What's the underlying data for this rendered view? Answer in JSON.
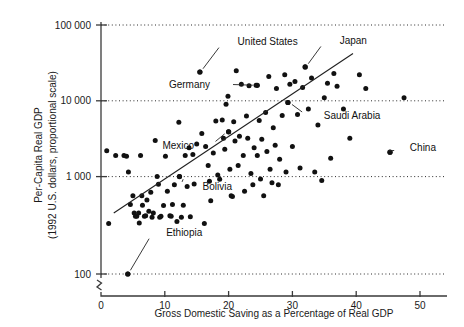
{
  "chart_data": {
    "type": "scatter",
    "title": "",
    "xlabel": "Gross Domestic Saving as a Percentage of Real GDP",
    "ylabel_line1": "Per-Capita Real GDP",
    "ylabel_line2": "(1992 U.S. dollars, proportional scale)",
    "yscale": "log",
    "xlim": [
      0,
      55
    ],
    "ylim": [
      100,
      100000
    ],
    "xticks": [
      0,
      10,
      20,
      30,
      40,
      50
    ],
    "xtick_labels": [
      "0",
      "10",
      "20",
      "30",
      "40",
      "50"
    ],
    "yticks": [
      100,
      1000,
      10000,
      100000
    ],
    "ytick_labels": [
      "100",
      "1 000",
      "10 000",
      "100 000"
    ],
    "grid": "horizontal dotted at each y tick",
    "axis_break": "y-axis broken between 100 and baseline",
    "legend": "none",
    "trendline": {
      "label": "regression line",
      "x_start": 2.0,
      "y_start": 330,
      "x_end": 39.5,
      "y_end": 42000
    },
    "annotations": [
      {
        "label": "United States",
        "x": 15.5,
        "y": 24000,
        "label_x": 20.0,
        "label_y": 60000
      },
      {
        "label": "Japan",
        "x": 32.0,
        "y": 28000,
        "label_x": 36.0,
        "label_y": 62000
      },
      {
        "label": "Germany",
        "x": 24.5,
        "y": 16000,
        "label_x": 18.5,
        "label_y": 16500
      },
      {
        "label": "Mexico",
        "x": 20.0,
        "y": 3900,
        "label_x": 16.0,
        "label_y": 2600
      },
      {
        "label": "Saudi Arabia",
        "x": 29.3,
        "y": 9500,
        "label_x": 33.5,
        "label_y": 6400
      },
      {
        "label": "China",
        "x": 45.3,
        "y": 2100,
        "label_x": 47.0,
        "label_y": 2400
      },
      {
        "label": "Bolivia",
        "x": 12.3,
        "y": 1000,
        "label_x": 14.5,
        "label_y": 740
      },
      {
        "label": "Ethiopia",
        "x": 4.2,
        "y": 100,
        "label_x": 8.8,
        "label_y": 185
      }
    ],
    "points": [
      [
        0.9,
        2200
      ],
      [
        1.2,
        240
      ],
      [
        2.3,
        1900
      ],
      [
        3.6,
        1900
      ],
      [
        4.0,
        1850
      ],
      [
        4.3,
        1150
      ],
      [
        4.2,
        100
      ],
      [
        4.6,
        430
      ],
      [
        5.0,
        560
      ],
      [
        5.2,
        330
      ],
      [
        5.4,
        300
      ],
      [
        5.6,
        300
      ],
      [
        5.9,
        330
      ],
      [
        6.0,
        245
      ],
      [
        6.2,
        1900
      ],
      [
        6.4,
        560
      ],
      [
        6.5,
        420
      ],
      [
        6.8,
        300
      ],
      [
        7.0,
        305
      ],
      [
        7.2,
        490
      ],
      [
        7.5,
        350
      ],
      [
        7.8,
        620
      ],
      [
        8.0,
        290
      ],
      [
        8.2,
        330
      ],
      [
        8.5,
        3000
      ],
      [
        8.8,
        1000
      ],
      [
        9.0,
        790
      ],
      [
        9.2,
        290
      ],
      [
        9.4,
        300
      ],
      [
        9.8,
        415
      ],
      [
        10.1,
        1850
      ],
      [
        10.4,
        640
      ],
      [
        10.8,
        305
      ],
      [
        11.0,
        300
      ],
      [
        11.2,
        430
      ],
      [
        11.5,
        780
      ],
      [
        11.9,
        255
      ],
      [
        12.2,
        5200
      ],
      [
        12.3,
        1000
      ],
      [
        12.6,
        290
      ],
      [
        12.9,
        420
      ],
      [
        13.2,
        1900
      ],
      [
        13.5,
        740
      ],
      [
        13.8,
        2400
      ],
      [
        14.0,
        295
      ],
      [
        14.4,
        1950
      ],
      [
        14.6,
        800
      ],
      [
        15.0,
        2700
      ],
      [
        15.5,
        24000
      ],
      [
        15.8,
        3700
      ],
      [
        16.2,
        240
      ],
      [
        16.4,
        2500
      ],
      [
        16.8,
        1400
      ],
      [
        17.0,
        870
      ],
      [
        17.2,
        480
      ],
      [
        17.6,
        2050
      ],
      [
        18.0,
        5400
      ],
      [
        18.3,
        1050
      ],
      [
        18.6,
        920
      ],
      [
        19.0,
        5600
      ],
      [
        19.2,
        3200
      ],
      [
        19.4,
        2300
      ],
      [
        19.6,
        9000
      ],
      [
        19.9,
        11500
      ],
      [
        20.0,
        3900
      ],
      [
        20.2,
        1250
      ],
      [
        20.4,
        560
      ],
      [
        20.6,
        545
      ],
      [
        20.8,
        5300
      ],
      [
        21.0,
        2950
      ],
      [
        21.2,
        25000
      ],
      [
        21.5,
        1400
      ],
      [
        21.7,
        3400
      ],
      [
        22.0,
        16500
      ],
      [
        22.3,
        1900
      ],
      [
        22.5,
        640
      ],
      [
        22.8,
        6300
      ],
      [
        23.0,
        3200
      ],
      [
        23.2,
        15800
      ],
      [
        23.5,
        1100
      ],
      [
        23.8,
        780
      ],
      [
        24.0,
        2400
      ],
      [
        24.3,
        16000
      ],
      [
        24.5,
        1900
      ],
      [
        24.8,
        5500
      ],
      [
        25.0,
        930
      ],
      [
        25.2,
        3100
      ],
      [
        25.5,
        560
      ],
      [
        25.8,
        7000
      ],
      [
        26.0,
        2150
      ],
      [
        26.3,
        21000
      ],
      [
        26.5,
        1250
      ],
      [
        26.8,
        830
      ],
      [
        27.0,
        4400
      ],
      [
        27.3,
        2600
      ],
      [
        27.5,
        14500
      ],
      [
        27.8,
        780
      ],
      [
        28.0,
        1700
      ],
      [
        28.4,
        6400
      ],
      [
        28.8,
        22000
      ],
      [
        29.0,
        1150
      ],
      [
        29.3,
        9500
      ],
      [
        29.6,
        16500
      ],
      [
        30.0,
        2500
      ],
      [
        30.4,
        18000
      ],
      [
        30.8,
        6600
      ],
      [
        31.2,
        1300
      ],
      [
        31.6,
        15000
      ],
      [
        32.0,
        28000
      ],
      [
        32.5,
        7800
      ],
      [
        33.0,
        20000
      ],
      [
        33.5,
        1150
      ],
      [
        34.0,
        4800
      ],
      [
        34.6,
        890
      ],
      [
        35.0,
        11000
      ],
      [
        35.5,
        17000
      ],
      [
        36.0,
        1750
      ],
      [
        36.5,
        23000
      ],
      [
        37.0,
        15500
      ],
      [
        38.0,
        7800
      ],
      [
        39.0,
        3200
      ],
      [
        40.5,
        22000
      ],
      [
        41.5,
        14500
      ],
      [
        45.3,
        2100
      ],
      [
        47.5,
        11000
      ]
    ]
  },
  "figure": {
    "x_axis_label": "Gross Domestic Saving as a Percentage of Real GDP",
    "y_axis_label_top": "Per-Capita Real GDP",
    "y_axis_label_bottom": "(1992 U.S. dollars, proportional scale)"
  }
}
